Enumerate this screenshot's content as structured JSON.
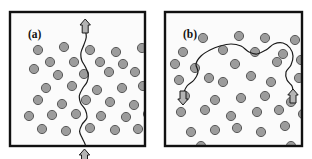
{
  "figure": {
    "background_color": "#ffffff",
    "width": 312,
    "height": 159,
    "style": {
      "frame_color": "#111111",
      "frame_width": 2.4,
      "panel_fill": "#fbfbfb",
      "particle_fill": "#9c9c9c",
      "particle_stroke": "#5a5a5a",
      "particle_stroke_width": 1,
      "particle_radius": 4.6,
      "path_color": "#1a1a1a",
      "path_width": 1.2,
      "arrow_fill": "#b4b4b4",
      "arrow_stroke": "#1a1a1a"
    }
  },
  "panels": [
    {
      "id": "a",
      "label": "(a)",
      "label_x": 18,
      "label_y": 26,
      "frame": {
        "x": 10,
        "y": 12,
        "w": 135,
        "h": 134
      },
      "path_orientation": "vertical",
      "path_description": "wavy near-vertical crack spanning panel from bottom edge to top edge",
      "path_points": [
        [
          74.5,
          150.0
        ],
        [
          74.2,
          142.0
        ],
        [
          75.6,
          134.0
        ],
        [
          72.4,
          126.5
        ],
        [
          69.6,
          119.5
        ],
        [
          72.0,
          112.5
        ],
        [
          76.8,
          106.0
        ],
        [
          75.4,
          98.0
        ],
        [
          70.6,
          91.0
        ],
        [
          69.4,
          83.5
        ],
        [
          72.6,
          76.5
        ],
        [
          77.0,
          70.0
        ],
        [
          78.2,
          62.5
        ],
        [
          75.4,
          55.0
        ],
        [
          71.6,
          48.0
        ],
        [
          71.0,
          40.5
        ],
        [
          73.8,
          33.0
        ],
        [
          76.2,
          25.5
        ],
        [
          75.6,
          18.0
        ],
        [
          75.2,
          9.0
        ]
      ],
      "arrows": [
        {
          "name": "top-arrow",
          "x": 75.2,
          "y": 14.0,
          "direction": "up"
        },
        {
          "name": "bottom-arrow",
          "x": 74.5,
          "y": 144.0,
          "direction": "up"
        }
      ],
      "particles": [
        [
          28,
          38
        ],
        [
          54,
          35
        ],
        [
          80,
          38
        ],
        [
          106,
          40
        ],
        [
          132,
          36
        ],
        [
          40,
          50
        ],
        [
          64,
          50
        ],
        [
          90,
          50
        ],
        [
          113,
          52
        ],
        [
          24,
          57
        ],
        [
          48,
          63
        ],
        [
          74,
          62
        ],
        [
          99,
          60
        ],
        [
          125,
          60
        ],
        [
          36,
          76
        ],
        [
          62,
          74
        ],
        [
          87,
          78
        ],
        [
          112,
          76
        ],
        [
          133,
          74
        ],
        [
          28,
          88
        ],
        [
          52,
          92
        ],
        [
          76,
          88
        ],
        [
          100,
          90
        ],
        [
          124,
          93
        ],
        [
          19,
          104
        ],
        [
          42,
          103
        ],
        [
          66,
          102
        ],
        [
          91,
          104
        ],
        [
          116,
          105
        ],
        [
          138,
          102
        ],
        [
          32,
          117
        ],
        [
          56,
          119
        ],
        [
          80,
          116
        ],
        [
          105,
          118
        ],
        [
          128,
          117
        ]
      ]
    },
    {
      "id": "b",
      "label": "(b)",
      "label_x": 18,
      "label_y": 26,
      "frame": {
        "x": 9,
        "y": 12,
        "w": 137,
        "h": 134
      },
      "path_orientation": "horizontal-arched",
      "path_description": "meandering arched path entering from lower left and exiting to lower right, bulging upward across the top half",
      "path_points": [
        [
          18.0,
          82.0
        ],
        [
          22.0,
          74.0
        ],
        [
          29.0,
          68.0
        ],
        [
          33.0,
          60.0
        ],
        [
          31.0,
          52.0
        ],
        [
          36.0,
          44.0
        ],
        [
          45.0,
          38.0
        ],
        [
          55.0,
          34.0
        ],
        [
          66.0,
          32.0
        ],
        [
          76.0,
          34.0
        ],
        [
          84.0,
          40.0
        ],
        [
          92.0,
          42.0
        ],
        [
          101.0,
          38.0
        ],
        [
          109.0,
          32.0
        ],
        [
          118.0,
          31.0
        ],
        [
          125.0,
          36.0
        ],
        [
          128.0,
          44.0
        ],
        [
          126.0,
          53.0
        ],
        [
          121.0,
          60.0
        ],
        [
          122.0,
          68.0
        ],
        [
          127.0,
          74.0
        ],
        [
          128.0,
          80.0
        ]
      ],
      "arrows": [
        {
          "name": "left-arrow",
          "x": 18.0,
          "y": 86.0,
          "direction": "down"
        },
        {
          "name": "right-arrow",
          "x": 128.0,
          "y": 84.0,
          "direction": "up"
        }
      ],
      "particles": [
        [
          38,
          26
        ],
        [
          74,
          24
        ],
        [
          100,
          26
        ],
        [
          130,
          28
        ],
        [
          18,
          40
        ],
        [
          58,
          38
        ],
        [
          90,
          40
        ],
        [
          118,
          42
        ],
        [
          10,
          52
        ],
        [
          30,
          56
        ],
        [
          70,
          52
        ],
        [
          112,
          50
        ],
        [
          136,
          48
        ],
        [
          14,
          68
        ],
        [
          44,
          66
        ],
        [
          58,
          70
        ],
        [
          86,
          64
        ],
        [
          106,
          70
        ],
        [
          134,
          66
        ],
        [
          20,
          84
        ],
        [
          50,
          88
        ],
        [
          76,
          86
        ],
        [
          100,
          84
        ],
        [
          126,
          90
        ],
        [
          16,
          100
        ],
        [
          40,
          98
        ],
        [
          66,
          104
        ],
        [
          92,
          100
        ],
        [
          114,
          98
        ],
        [
          138,
          102
        ],
        [
          26,
          120
        ],
        [
          50,
          118
        ],
        [
          72,
          116
        ],
        [
          96,
          120
        ],
        [
          120,
          114
        ],
        [
          36,
          134
        ],
        [
          126,
          134
        ]
      ]
    }
  ]
}
